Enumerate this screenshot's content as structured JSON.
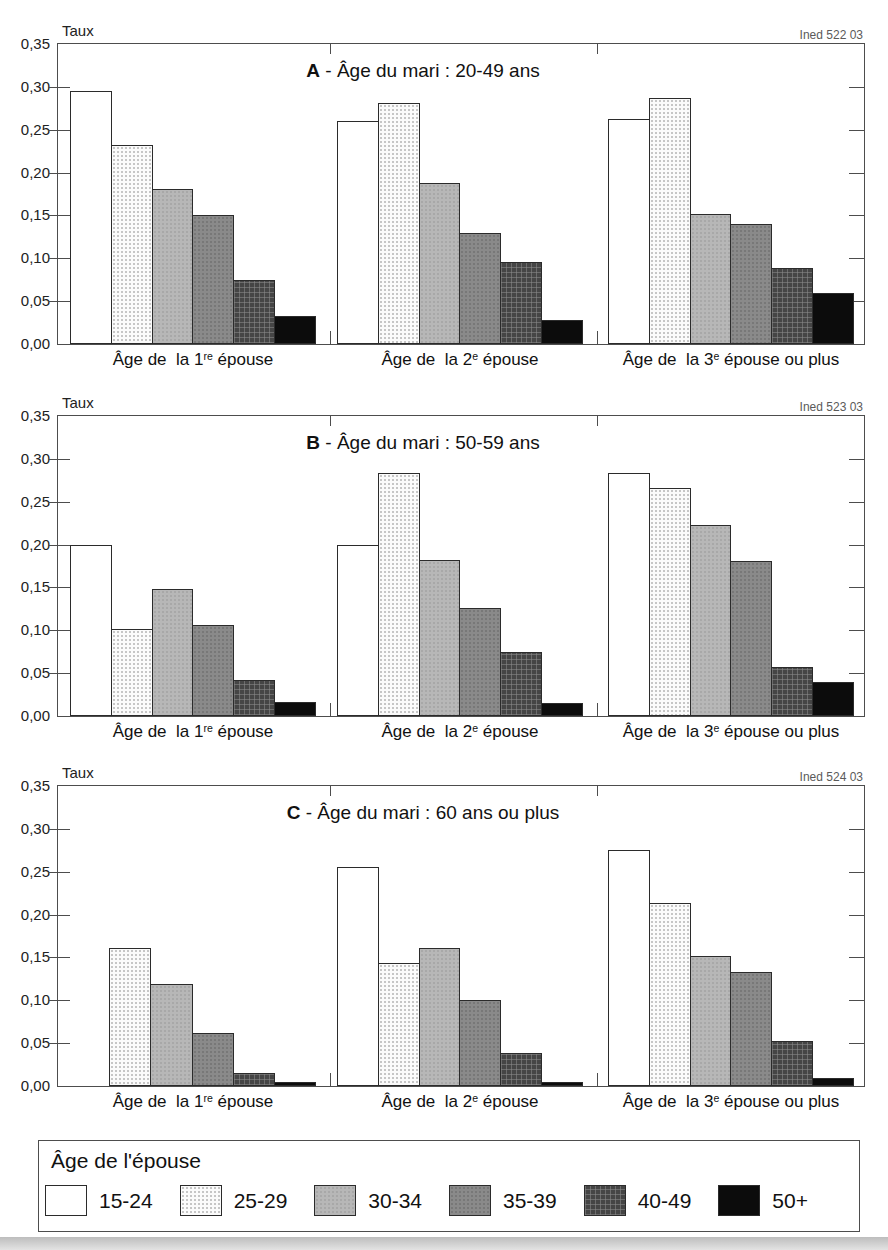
{
  "page": {
    "background": "#ffffff",
    "bottom_edge_color": "#c8c8c8"
  },
  "axis": {
    "label": "Taux",
    "tick_labels": [
      "0,35",
      "0,30",
      "0,25",
      "0,20",
      "0,15",
      "0,10",
      "0,05",
      "0,00"
    ],
    "ymin": 0,
    "ymax": 0.35
  },
  "group_labels": [
    {
      "pre": "Âge de  la 1",
      "sup": "re",
      "post": " épouse"
    },
    {
      "pre": "Âge de  la 2",
      "sup": "e",
      "post": " épouse"
    },
    {
      "pre": "Âge de  la 3",
      "sup": "e",
      "post": " épouse ou plus"
    }
  ],
  "legend": {
    "title": "Âge de l'épouse",
    "items": [
      {
        "label": "15-24",
        "pattern": "white"
      },
      {
        "label": "25-29",
        "pattern": "dots-light"
      },
      {
        "label": "30-34",
        "pattern": "gray-light"
      },
      {
        "label": "35-39",
        "pattern": "gray-medium"
      },
      {
        "label": "40-49",
        "pattern": "crosshatch-dark"
      },
      {
        "label": "50+",
        "pattern": "black"
      }
    ]
  },
  "chart_data": [
    {
      "type": "bar",
      "title": "A - Âge du mari : 20-49 ans",
      "title_letter": "A",
      "title_rest": " - Âge du mari : 20-49 ans",
      "source": "Ined 522 03",
      "ylabel": "Taux",
      "ylim": [
        0,
        0.35
      ],
      "grid": false,
      "categories": [
        "Âge de la 1re épouse",
        "Âge de la 2e épouse",
        "Âge de la 3e épouse ou plus"
      ],
      "series": [
        {
          "name": "15-24",
          "values": [
            0.295,
            0.26,
            0.263
          ]
        },
        {
          "name": "25-29",
          "values": [
            0.232,
            0.281,
            0.287
          ]
        },
        {
          "name": "30-34",
          "values": [
            0.181,
            0.188,
            0.152
          ]
        },
        {
          "name": "35-39",
          "values": [
            0.151,
            0.129,
            0.14
          ]
        },
        {
          "name": "40-49",
          "values": [
            0.075,
            0.096,
            0.089
          ]
        },
        {
          "name": "50+",
          "values": [
            0.033,
            0.028,
            0.059
          ]
        }
      ]
    },
    {
      "type": "bar",
      "title": "B - Âge du mari : 50-59 ans",
      "title_letter": "B",
      "title_rest": " - Âge du mari : 50-59 ans",
      "source": "Ined 523 03",
      "ylabel": "Taux",
      "ylim": [
        0,
        0.35
      ],
      "grid": false,
      "categories": [
        "Âge de la 1re épouse",
        "Âge de la 2e épouse",
        "Âge de la 3e épouse ou plus"
      ],
      "series": [
        {
          "name": "15-24",
          "values": [
            0.199,
            0.199,
            0.283
          ]
        },
        {
          "name": "25-29",
          "values": [
            0.102,
            0.284,
            0.266
          ]
        },
        {
          "name": "30-34",
          "values": [
            0.148,
            0.182,
            0.223
          ]
        },
        {
          "name": "35-39",
          "values": [
            0.106,
            0.126,
            0.181
          ]
        },
        {
          "name": "40-49",
          "values": [
            0.042,
            0.075,
            0.057
          ]
        },
        {
          "name": "50+",
          "values": [
            0.016,
            0.015,
            0.04
          ]
        }
      ]
    },
    {
      "type": "bar",
      "title": "C - Âge du mari : 60 ans ou plus",
      "title_letter": "C",
      "title_rest": " - Âge du mari : 60 ans ou plus",
      "source": "Ined 524 03",
      "ylabel": "Taux",
      "ylim": [
        0,
        0.35
      ],
      "grid": false,
      "categories": [
        "Âge de la 1re épouse",
        "Âge de la 2e épouse",
        "Âge de la 3e épouse ou plus"
      ],
      "series": [
        {
          "name": "15-24",
          "values": [
            0.0,
            0.256,
            0.275
          ]
        },
        {
          "name": "25-29",
          "values": [
            0.161,
            0.143,
            0.213
          ]
        },
        {
          "name": "30-34",
          "values": [
            0.119,
            0.161,
            0.152
          ]
        },
        {
          "name": "35-39",
          "values": [
            0.062,
            0.1,
            0.133
          ]
        },
        {
          "name": "40-49",
          "values": [
            0.015,
            0.038,
            0.052
          ]
        },
        {
          "name": "50+",
          "values": [
            0.005,
            0.005,
            0.009
          ]
        }
      ]
    }
  ]
}
